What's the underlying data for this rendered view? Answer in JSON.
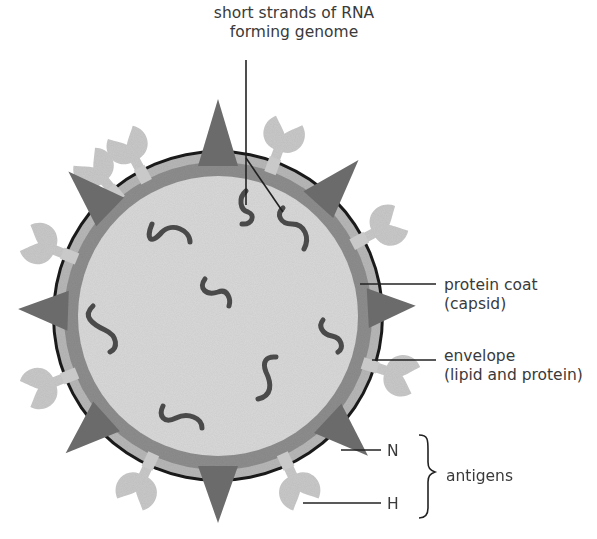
{
  "diagram": {
    "labels": {
      "genome_line1": "short strands of RNA",
      "genome_line2": "forming genome",
      "capsid_line1": "protein coat",
      "capsid_line2": "(capsid)",
      "envelope_line1": "envelope",
      "envelope_line2": "(lipid and protein)",
      "n_antigen": "N",
      "h_antigen": "H",
      "antigens_group": "antigens"
    },
    "virus": {
      "center": [
        218,
        316
      ],
      "outline_radius": 166,
      "envelope_radius": 163,
      "capsid_radius": 154,
      "core_radius": 140,
      "rna_strand_count": 9,
      "n_spike_count": 9,
      "h_spike_count": 9
    },
    "colors": {
      "outline": "#1a1a1a",
      "envelope": "#b8b8b8",
      "capsid": "#8e8e8e",
      "core": "#d9d9d9",
      "n_spike": "#6b6b6b",
      "h_spike": "#c9c9c9",
      "rna": "#4a4a4a",
      "leader_line": "#222222",
      "text": "#3a3a3a"
    }
  }
}
